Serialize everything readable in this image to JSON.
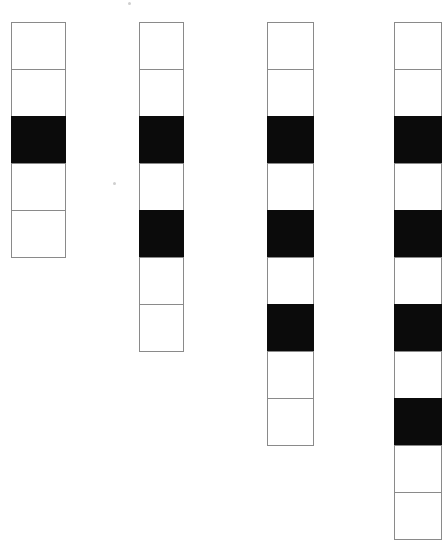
{
  "figure": {
    "type": "pattern-sequence",
    "background_color": "#ffffff",
    "border_color": "#8a8a8a",
    "fill_color": "#0b0b0b",
    "empty_color": "#ffffff",
    "canvas": {
      "width": 447,
      "height": 554
    },
    "cell": {
      "height": 48
    },
    "columns": [
      {
        "name": "strip-1",
        "index": 1,
        "left": 11,
        "top": 22,
        "width": 55,
        "cell_count": 5,
        "filled_count": 1,
        "cells": [
          "white",
          "white",
          "black",
          "white",
          "white"
        ]
      },
      {
        "name": "strip-2",
        "index": 2,
        "left": 139,
        "top": 22,
        "width": 45,
        "cell_count": 7,
        "filled_count": 2,
        "cells": [
          "white",
          "white",
          "black",
          "white",
          "black",
          "white",
          "white"
        ]
      },
      {
        "name": "strip-3",
        "index": 3,
        "left": 267,
        "top": 22,
        "width": 47,
        "cell_count": 9,
        "filled_count": 3,
        "cells": [
          "white",
          "white",
          "black",
          "white",
          "black",
          "white",
          "black",
          "white",
          "white"
        ]
      },
      {
        "name": "strip-4",
        "index": 4,
        "left": 394,
        "top": 22,
        "width": 48,
        "cell_count": 11,
        "filled_count": 4,
        "cells": [
          "white",
          "white",
          "black",
          "white",
          "black",
          "white",
          "black",
          "white",
          "black",
          "white",
          "white"
        ]
      }
    ],
    "specks": [
      {
        "name": "speck-top",
        "left": 128,
        "top": 2,
        "size": 3
      },
      {
        "name": "speck-mid",
        "left": 113,
        "top": 182,
        "size": 3
      }
    ]
  }
}
